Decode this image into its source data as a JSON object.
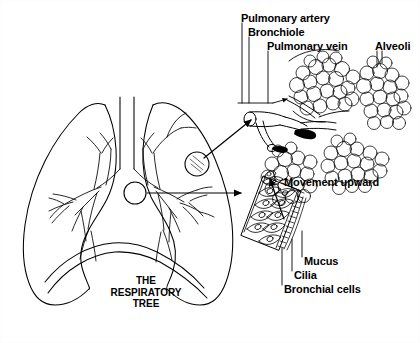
{
  "figure": {
    "title": "The Respiratory Tree",
    "background_color": "#ffffff",
    "ink_color": "#000000",
    "width": 420,
    "height": 343
  },
  "caption": {
    "line1": "THE",
    "line2": "RESPIRATORY",
    "line3": "TREE"
  },
  "labels": {
    "pulmonary_artery": "Pulmonary artery",
    "bronchiole": "Bronchiole",
    "pulmonary_vein": "Pulmonary vein",
    "alveoli": "Alveoli",
    "movement_upward": "Movement upward",
    "mucus": "Mucus",
    "cilia": "Cilia",
    "bronchial_cells": "Bronchial cells"
  },
  "panels": {
    "lungs": {
      "name": "lungs-cutaway",
      "callout_upper": "alveoli-region-circle",
      "callout_lower": "bronchiole-wall-region-circle"
    },
    "alveoli_inset": {
      "name": "alveolar-cluster-inset"
    },
    "epithelium_inset": {
      "name": "ciliated-epithelium-inset"
    }
  },
  "icons": {
    "arrow_to_alveoli": "arrow-icon",
    "arrow_to_epithelium": "arrow-icon",
    "movement_arrow": "arrow-up-icon"
  }
}
